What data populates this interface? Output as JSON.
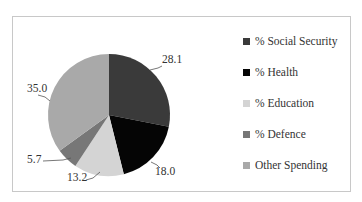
{
  "chart_data": {
    "type": "pie",
    "title": "",
    "categories": [
      "% Social Security",
      "% Health",
      "% Education",
      "% Defence",
      "Other Spending"
    ],
    "values": [
      28.1,
      18.0,
      13.2,
      5.7,
      35.0
    ],
    "colors": [
      "#3a3a3a",
      "#050505",
      "#d4d4d4",
      "#777777",
      "#a9a9a9"
    ],
    "data_labels": [
      "28.1",
      "18.0",
      "13.2",
      "5.7",
      "35.0"
    ],
    "legend_position": "right",
    "start_angle": "12 o'clock, clockwise"
  },
  "legend": {
    "items": [
      {
        "label": "% Social Security",
        "color": "#3a3a3a"
      },
      {
        "label": "% Health",
        "color": "#050505"
      },
      {
        "label": "% Education",
        "color": "#d4d4d4"
      },
      {
        "label": "% Defence",
        "color": "#777777"
      },
      {
        "label": "Other Spending",
        "color": "#a9a9a9"
      }
    ]
  }
}
